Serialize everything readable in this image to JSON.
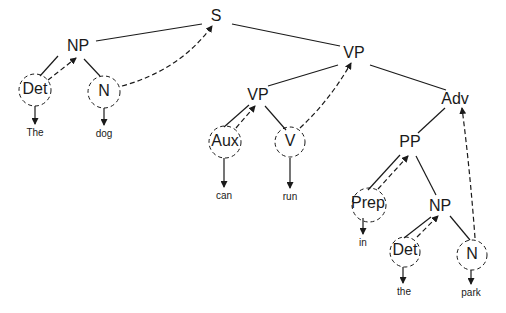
{
  "diagram": {
    "type": "syntax-tree",
    "nodes": {
      "s": {
        "label": "S",
        "x": 216,
        "y": 17
      },
      "np1": {
        "label": "NP",
        "x": 78,
        "y": 47
      },
      "det1": {
        "label": "Det",
        "x": 35,
        "y": 90,
        "circled": true
      },
      "n1": {
        "label": "N",
        "x": 104,
        "y": 91,
        "circled": true
      },
      "vp1": {
        "label": "VP",
        "x": 354,
        "y": 54
      },
      "vp2": {
        "label": "VP",
        "x": 258,
        "y": 96
      },
      "adv": {
        "label": "Adv",
        "x": 455,
        "y": 100
      },
      "aux": {
        "label": "Aux",
        "x": 225,
        "y": 141,
        "circled": true
      },
      "v": {
        "label": "V",
        "x": 289,
        "y": 141,
        "circled": true
      },
      "pp": {
        "label": "PP",
        "x": 410,
        "y": 143
      },
      "prep": {
        "label": "Prep",
        "x": 367,
        "y": 203,
        "circled": true
      },
      "np2": {
        "label": "NP",
        "x": 440,
        "y": 207
      },
      "det2": {
        "label": "Det",
        "x": 405,
        "y": 251,
        "circled": true
      },
      "n2": {
        "label": "N",
        "x": 471,
        "y": 255,
        "circled": true
      }
    },
    "words": {
      "the1": {
        "label": "The",
        "x": 35,
        "y": 133
      },
      "dog": {
        "label": "dog",
        "x": 104,
        "y": 134
      },
      "can": {
        "label": "can",
        "x": 224,
        "y": 196
      },
      "run": {
        "label": "run",
        "x": 290,
        "y": 197
      },
      "in": {
        "label": "in",
        "x": 362,
        "y": 243
      },
      "the2": {
        "label": "the",
        "x": 405,
        "y": 292
      },
      "park": {
        "label": "park",
        "x": 470,
        "y": 293
      }
    },
    "sentence": "The dog can run in the park",
    "edge_style": {
      "tree": "solid",
      "head_projection": "dashed-arrow",
      "lexical": "solid-arrow"
    }
  }
}
